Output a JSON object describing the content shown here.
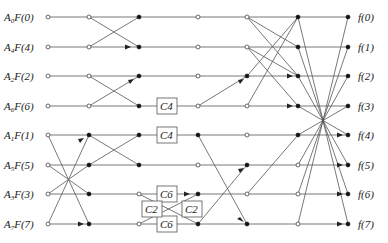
{
  "diagram": {
    "type": "signal-flow-graph",
    "inputs": [
      {
        "coef": "A",
        "sub": "0",
        "fn": "F(0)"
      },
      {
        "coef": "A",
        "sub": "4",
        "fn": "F(4)"
      },
      {
        "coef": "A",
        "sub": "2",
        "fn": "F(2)"
      },
      {
        "coef": "A",
        "sub": "6",
        "fn": "F(6)"
      },
      {
        "coef": "A",
        "sub": "1",
        "fn": "F(1)"
      },
      {
        "coef": "A",
        "sub": "5",
        "fn": "F(5)"
      },
      {
        "coef": "A",
        "sub": "3",
        "fn": "F(3)"
      },
      {
        "coef": "A",
        "sub": "7",
        "fn": "F(7)"
      }
    ],
    "outputs": [
      "f(0)",
      "f(1)",
      "f(2)",
      "f(3)",
      "f(4)",
      "f(5)",
      "f(6)",
      "f(7)"
    ],
    "boxes": [
      {
        "label": "C4",
        "row": 3
      },
      {
        "label": "C4",
        "row": 4
      },
      {
        "label": "C6",
        "row": 6
      },
      {
        "label": "C6",
        "row": 7
      },
      {
        "label": "C2",
        "position": "left-cross"
      },
      {
        "label": "C2",
        "position": "right-cross"
      }
    ]
  }
}
